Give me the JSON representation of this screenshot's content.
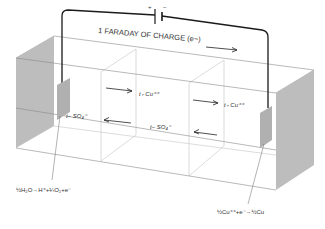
{
  "diagram": {
    "type": "electrolysis-cell (Hittorf transference)",
    "circuit": {
      "battery_plus": "+",
      "battery_minus": "|−",
      "charge_label": "1 FARADAY OF CHARGE (e−)"
    },
    "compartments": [
      "anode",
      "middle",
      "cathode"
    ],
    "ion_labels": {
      "cation_left": "t₊ Cu⁺⁺",
      "cation_right": "t₊ Cu⁺⁺",
      "anion_left": "t− SO₄⁼",
      "anion_middle": "t− SO₄⁼"
    },
    "reactions": {
      "anode": "½H₂O→H⁺+¼O₂+e⁻",
      "cathode": "½Cu⁺⁺+e⁻→½Cu"
    },
    "colors": {
      "wire": "#1a1a1a",
      "electrode": "#b8b8b8",
      "end_wall": "#bdbdbd",
      "box_edge": "#8a8a8a"
    }
  }
}
